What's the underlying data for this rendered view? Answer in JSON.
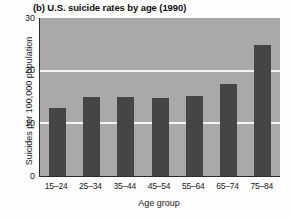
{
  "chart_data": {
    "type": "bar",
    "title": "(b) U.S. suicide rates by age (1990)",
    "xlabel": "Age group",
    "ylabel": "Suicides per 100,000 population",
    "categories": [
      "15–24",
      "25–34",
      "35–44",
      "45–54",
      "55–64",
      "65–74",
      "75–84"
    ],
    "values": [
      13,
      15,
      15,
      14.8,
      15.2,
      17.4,
      24.8
    ],
    "ylim": [
      0,
      30
    ],
    "yticks": [
      0,
      10,
      20,
      30
    ],
    "ytick_labels": [
      "0",
      "10",
      "20",
      "30"
    ],
    "grid": "horizontal-only",
    "gridline_values": [
      10,
      20
    ],
    "legend": "none",
    "colors": {
      "bar": "#454545",
      "plot_background": "#a9a9a9",
      "gridline": "#f4f4f4",
      "axis": "#2b2b2b",
      "text": "#1a1a1a",
      "page_background": "#fdfdfd"
    }
  }
}
